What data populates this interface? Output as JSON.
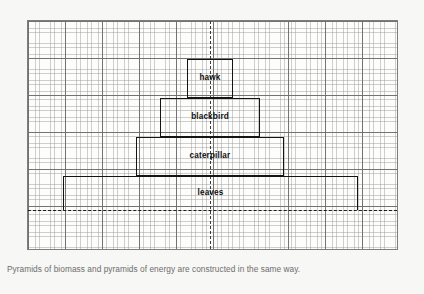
{
  "figure": {
    "caption": "Pyramids of biomass and pyramids of energy are constructed in the same way.",
    "background_color": "#f7f7f5",
    "plot_background_color": "#fdfdfc",
    "border_color": "#7d7d7d",
    "tier_border_color": "#141414",
    "grid_fine_color": "#969698",
    "grid_major_color": "#6e6e70",
    "caption_color": "#6d6d6d"
  },
  "chart_data": {
    "type": "bar",
    "title": "",
    "subtitle": "",
    "xlabel": "",
    "ylabel": "",
    "orientation": "horizontal-centered",
    "grid": true,
    "grid_minor_cell_px": 3.71,
    "grid_major_every_cells": 10,
    "legend": "none",
    "axis_guides": {
      "vertical_center_dashed": true,
      "baseline_dashed": true
    },
    "categories": [
      "leaves",
      "caterpillar",
      "blackbird",
      "hawk"
    ],
    "values": [
      80,
      40,
      27,
      12.5
    ],
    "units": "grid cells (relative bar width)",
    "xlim": [
      -50,
      50
    ],
    "ylim": [
      0,
      4
    ],
    "bars": [
      {
        "label": "leaves",
        "trophic_level": 1,
        "width_cells": 80,
        "height_cells": 9,
        "left_px": 62,
        "right_px": 357,
        "top_px": 175,
        "bottom_px": 209,
        "open_bottom": true
      },
      {
        "label": "caterpillar",
        "trophic_level": 2,
        "width_cells": 40,
        "height_cells": 10,
        "left_px": 135,
        "right_px": 283,
        "top_px": 136,
        "bottom_px": 175,
        "open_bottom": false
      },
      {
        "label": "blackbird",
        "trophic_level": 3,
        "width_cells": 27,
        "height_cells": 10,
        "left_px": 159,
        "right_px": 259,
        "top_px": 97,
        "bottom_px": 136,
        "open_bottom": false
      },
      {
        "label": "hawk",
        "trophic_level": 4,
        "width_cells": 12.5,
        "height_cells": 10,
        "left_px": 186,
        "right_px": 232,
        "top_px": 58,
        "bottom_px": 97,
        "open_bottom": false
      }
    ],
    "center_axis_px": 209,
    "baseline_px": 209
  },
  "plot": {
    "left_px": 27,
    "top_px": 20,
    "width_px": 371,
    "height_px": 230
  }
}
